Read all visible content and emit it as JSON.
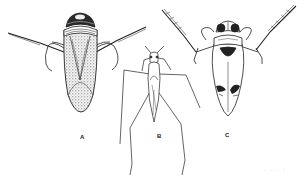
{
  "figure": {
    "labels": {
      "a": "A",
      "b": "B",
      "c": "C"
    },
    "footer_marks": ". . . :",
    "colors": {
      "ink": "#222222",
      "background": "#ffffff"
    }
  }
}
